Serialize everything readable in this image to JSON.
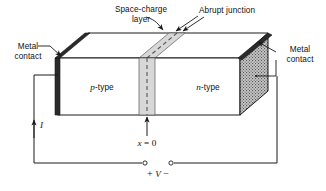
{
  "figure": {
    "kind": "pn-junction-device-schematic",
    "background_color": "#ffffff",
    "line_color": "#1a1a1a"
  },
  "labels": {
    "space_charge_line1": "Space-charge",
    "space_charge_line2": "layer",
    "abrupt_junction": "Abrupt junction",
    "metal_contact_left_line1": "Metal",
    "metal_contact_left_line2": "contact",
    "metal_contact_right_line1": "Metal",
    "metal_contact_right_line2": "contact",
    "p_region_symbol": "p",
    "p_region_suffix": "-type",
    "n_region_symbol": "n",
    "n_region_suffix": "-type",
    "origin_symbol": "x",
    "origin_equals": " = 0",
    "current_symbol": "I",
    "plus_sign": "+",
    "voltage_symbol": "V",
    "minus_sign": "−"
  },
  "colors": {
    "space_charge_fill": "#d8d8d8",
    "contact_dark": "#2a2a2a",
    "contact_hatch_light": "#c9c9c9",
    "body_fill": "#ffffff",
    "top_face_fill": "#ffffff",
    "wire": "#1a1a1a"
  },
  "icons": {
    "current_arrow": "up-arrow-icon",
    "origin_arrow": "up-arrow-icon",
    "abrupt_leader_arrows": "double-arrow-icon",
    "metal_leader_left": "leader-line-icon",
    "metal_leader_right": "arrow-leader-icon",
    "terminal_left": "open-circle-terminal-icon",
    "terminal_right": "open-circle-terminal-icon"
  },
  "geometry": {
    "front_face": {
      "x0": 58,
      "y0": 58,
      "x1": 240,
      "y1": 115
    },
    "top_back_edge": {
      "x0": 88,
      "y0": 33,
      "x1": 268,
      "y1": 33
    },
    "space_charge_front": {
      "x0": 139,
      "x1": 155
    },
    "junction_x_front": 147,
    "circuit": {
      "left_x": 34,
      "bottom_y": 163,
      "right_x": 277,
      "terminal_left_x": 145,
      "terminal_right_x": 171,
      "terminal_y": 163
    }
  }
}
